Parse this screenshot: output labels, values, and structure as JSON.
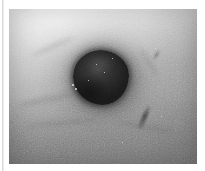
{
  "page": {
    "background_color": "#ffffff",
    "width": 205,
    "height": 171
  },
  "margin_rule": {
    "name": "left-margin-rule",
    "color": "#d8d8d8"
  },
  "photograph": {
    "caption": "",
    "alt_text": "Grayscale clinical photograph of skin showing a dark round pigmented lesion surrounded by a diffuse halo",
    "subject": "pigmented skin lesion",
    "modality": "clinical photograph",
    "color_mode": "grayscale",
    "frame": {
      "left": 9,
      "top": 9,
      "width": 188,
      "height": 155
    },
    "tones": {
      "highlight": "#e3e3e3",
      "midtone": "#b4b4b4",
      "shadow": "#8b8b8b",
      "halo": "#6a605a",
      "lesion_core": "#241f1d",
      "lesion_edge": "#3b3632",
      "glint": "#ece8e2"
    },
    "lesion": {
      "name": "pigmented-lesion",
      "center_x": 101,
      "center_y": 78,
      "width": 56,
      "height": 55,
      "shape": "round",
      "border": "irregular"
    },
    "halo": {
      "name": "perilesional-halo",
      "center_x": 101,
      "center_y": 81,
      "width": 168,
      "height": 140
    },
    "marks": [
      {
        "name": "streak-lower-right",
        "x": 133,
        "y": 95,
        "length": 26,
        "angle": 24
      },
      {
        "name": "streak-upper-right",
        "x": 146,
        "y": 40,
        "length": 12,
        "angle": 32
      }
    ],
    "glints": [
      {
        "x": 72,
        "y": 84,
        "size": 2
      },
      {
        "x": 75,
        "y": 88,
        "size": 2
      },
      {
        "x": 96,
        "y": 64,
        "size": 1
      },
      {
        "x": 104,
        "y": 72,
        "size": 1
      },
      {
        "x": 88,
        "y": 80,
        "size": 1
      },
      {
        "x": 112,
        "y": 58,
        "size": 1
      },
      {
        "x": 155,
        "y": 48,
        "size": 1
      },
      {
        "x": 161,
        "y": 116,
        "size": 1
      },
      {
        "x": 122,
        "y": 142,
        "size": 1
      }
    ],
    "creases": [
      {
        "x": 18,
        "y": 96,
        "w": 58,
        "h": 7,
        "angle": -12
      },
      {
        "x": 26,
        "y": 120,
        "w": 72,
        "h": 6,
        "angle": -5
      },
      {
        "x": 118,
        "y": 124,
        "w": 56,
        "h": 6,
        "angle": 10
      },
      {
        "x": 132,
        "y": 60,
        "w": 34,
        "h": 5,
        "angle": 58
      },
      {
        "x": 30,
        "y": 44,
        "w": 46,
        "h": 5,
        "angle": -24
      }
    ]
  }
}
